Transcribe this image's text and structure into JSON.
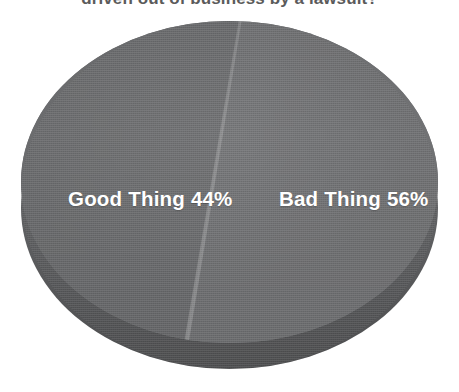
{
  "title": "driven out of business by a lawsuit?",
  "colors": {
    "slice_good": "#6b6c6e",
    "slice_bad": "#717274",
    "pie_side": "#5f6062",
    "label_text": "#ffffff",
    "title_text": "#5b5b5b",
    "background": "#ffffff"
  },
  "labels": {
    "good": "Good Thing 44%",
    "bad": "Bad Thing 56%"
  },
  "chart_data": {
    "type": "pie",
    "title": "driven out of business by a lawsuit?",
    "categories": [
      "Good Thing",
      "Bad Thing"
    ],
    "values": [
      44,
      56
    ],
    "value_unit": "%",
    "data_labels": [
      "Good Thing 44%",
      "Bad Thing 56%"
    ],
    "legend": "none",
    "legend_position": "inside-slices",
    "grid": false,
    "style": "3d-pie",
    "colors": [
      "#6b6c6e",
      "#717274"
    ]
  }
}
